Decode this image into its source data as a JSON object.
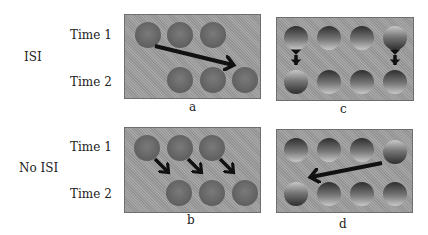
{
  "figure": {
    "rows": [
      {
        "condition": "ISI",
        "time1": "Time 1",
        "time2": "Time 2"
      },
      {
        "condition": "No ISI",
        "time1": "Time 1",
        "time2": "Time 2"
      }
    ],
    "panels": {
      "a": {
        "caption": "a",
        "description": "Uniform dark disks: 3 at Time 1 (left-aligned), 3 at Time 2 shifted right by one position; one long arrow from first Time 1 disk to last Time 2 disk (group motion)."
      },
      "b": {
        "caption": "b",
        "description": "Uniform dark disks: 3 at Time 1, 3 at Time 2 shifted right; three short diagonal arrows (element motion)."
      },
      "c": {
        "caption": "c",
        "description": "Shaded disks, 4 per row; end disks have reversed shading; vertical double-headed arrows at left and right columns."
      },
      "d": {
        "caption": "d",
        "description": "Shaded disks, 4 per row; reversed-shaded disks at top-right and bottom-left; long arrow from top-right to bottom-left."
      }
    },
    "colors": {
      "panel_bg": "#9c9c9c",
      "disk": "#6f6f6f",
      "arrow": "#111111",
      "text": "#222222"
    }
  }
}
